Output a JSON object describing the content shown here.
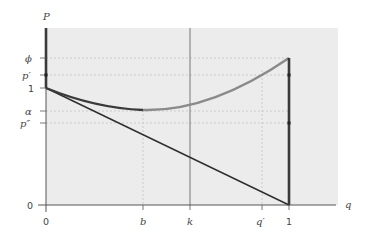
{
  "axes": {
    "y_label": "P",
    "x_label": "q",
    "y_ticks": [
      {
        "label": "ϕ",
        "y": 58,
        "italic": true
      },
      {
        "label": "p′",
        "y": 75,
        "italic": true
      },
      {
        "label": "1",
        "y": 88,
        "italic": false
      },
      {
        "label": "α",
        "y": 111,
        "italic": true
      },
      {
        "label": "p″",
        "y": 123,
        "italic": true
      },
      {
        "label": "0",
        "y": 205,
        "italic": false
      }
    ],
    "x_ticks": [
      {
        "label": "0",
        "x": 46,
        "italic": false
      },
      {
        "label": "b",
        "x": 143,
        "italic": true
      },
      {
        "label": "k",
        "x": 190,
        "italic": true
      },
      {
        "label": "q′",
        "x": 262,
        "italic": true
      },
      {
        "label": "1",
        "x": 289,
        "italic": false
      }
    ]
  },
  "colors": {
    "plot_background": "#ececec",
    "axis": "#555555",
    "dark_curve": "#3a3a3a",
    "light_curve": "#8a8a8a",
    "guide": "#c4c4c4",
    "vertical_k": "#777777"
  }
}
